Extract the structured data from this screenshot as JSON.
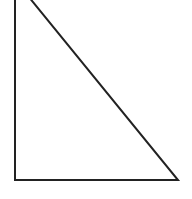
{
  "diagram": {
    "type": "right-triangle",
    "stroke_color": "#222222",
    "fill_color": "#ffffff",
    "stroke_width": 2,
    "vertices": {
      "apex": {
        "x": 15,
        "y": -20
      },
      "right_angle": {
        "x": 15,
        "y": 180
      },
      "base_end": {
        "x": 178,
        "y": 180
      }
    }
  }
}
